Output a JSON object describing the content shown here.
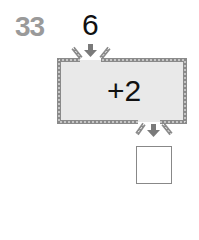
{
  "problem": {
    "number": "33",
    "input_value": "6",
    "operation": "+2",
    "answer": ""
  },
  "colors": {
    "number": "#9a9a9a",
    "machine_fill": "#e9e9e9",
    "machine_border": "#8a8a8a",
    "arrow": "#7a7a7a"
  }
}
